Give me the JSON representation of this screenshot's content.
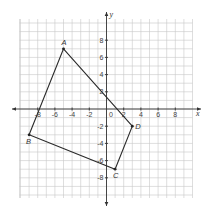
{
  "diagram": {
    "type": "coordinate-plane-polygon",
    "axes": {
      "x_label": "x",
      "y_label": "y",
      "x_range": [
        -10,
        10
      ],
      "y_range": [
        -10,
        10
      ],
      "grid_step": 1,
      "x_tick_labels": [
        "-8",
        "-6",
        "-4",
        "-2",
        "2",
        "4",
        "6",
        "8"
      ],
      "y_tick_labels": [
        "8",
        "6",
        "4",
        "2",
        "-2",
        "-4",
        "-6",
        "-8"
      ],
      "origin_label": "0"
    },
    "polygon": {
      "vertices": [
        {
          "label": "A",
          "x": -5,
          "y": 7
        },
        {
          "label": "D",
          "x": 3,
          "y": -2
        },
        {
          "label": "C",
          "x": 1,
          "y": -7
        },
        {
          "label": "B",
          "x": -9,
          "y": -3
        }
      ]
    },
    "colors": {
      "grid": "#c8c8c8",
      "axis": "#333333",
      "edge": "#2a2a2a"
    }
  }
}
